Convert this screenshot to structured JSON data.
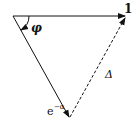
{
  "diagram": {
    "type": "phasor-triangle",
    "labels": {
      "top_vector": "1",
      "bottom_vector_base": "e",
      "bottom_vector_exp": "−α",
      "angle": "φ",
      "difference": "Δ"
    },
    "colors": {
      "stroke": "#111111",
      "background": "#ffffff"
    }
  }
}
